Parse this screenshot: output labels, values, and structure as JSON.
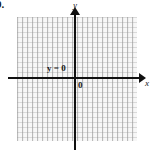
{
  "figure": {
    "problem_number": "9.",
    "caption": ""
  },
  "axes": {
    "x_label": "x",
    "y_label": "y",
    "origin_label": "0"
  },
  "annotations": {
    "equation": {
      "variable": "y",
      "operator": "=",
      "value": "0",
      "full": "y = 0"
    }
  },
  "colors": {
    "axis": "#111111",
    "grid_line": "#c9c9c9",
    "grid_fill": "#f7f7f7",
    "text": "#1a1a1a",
    "background": "#ffffff"
  },
  "chart_data": {
    "type": "line",
    "title": "",
    "subtitle": "",
    "xlabel": "x",
    "ylabel": "y",
    "xlim": [
      -12,
      12
    ],
    "ylim": [
      -12,
      12
    ],
    "grid": true,
    "grid_spacing": 1,
    "legend": "none",
    "series": [
      {
        "name": "y = 0",
        "equation": "y = 0",
        "type": "horizontal-line",
        "y_intercept": 0,
        "slope": 0,
        "x": [
          -12,
          12
        ],
        "values": [
          0,
          0
        ],
        "style": "solid-bold",
        "color": "#111111",
        "label": "y = 0",
        "label_position": "above-left-of-origin"
      }
    ],
    "annotations": [
      {
        "text": "y = 0",
        "x": -5.5,
        "y": 1.4
      },
      {
        "text": "0",
        "x": 0.6,
        "y": -0.8
      }
    ],
    "tick_labels": {
      "x": [],
      "y": []
    }
  }
}
